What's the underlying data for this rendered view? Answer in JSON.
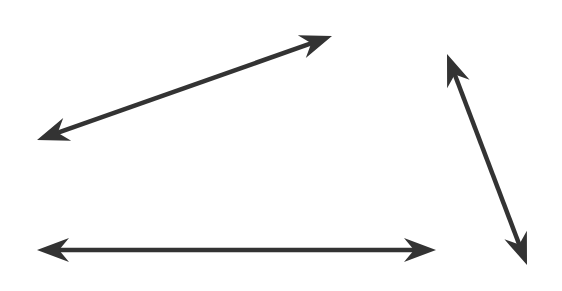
{
  "diagram": {
    "type": "geometry-lines",
    "stroke_color": "#333333",
    "background": "#ffffff",
    "lines": [
      {
        "name": "diagonal-line-rising",
        "double_headed": true
      },
      {
        "name": "steep-line-descending",
        "double_headed": true
      },
      {
        "name": "horizontal-line",
        "double_headed": true
      }
    ]
  }
}
